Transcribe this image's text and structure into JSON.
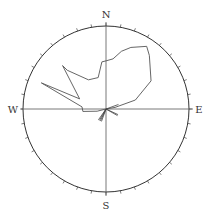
{
  "chart_data": {
    "type": "rose",
    "title": "",
    "directions": {
      "north": "N",
      "east": "E",
      "south": "S",
      "west": "W"
    },
    "tick_interval_deg": 10,
    "grid": false,
    "series": [
      {
        "name": "main-distribution",
        "style": "outline",
        "points_deg_radius_fraction": [
          [
            80,
            0.11
          ],
          [
            73,
            0.37
          ],
          [
            58,
            0.64
          ],
          [
            39,
            0.83
          ],
          [
            33,
            0.9
          ],
          [
            22,
            0.8
          ],
          [
            15,
            0.72
          ],
          [
            8,
            0.61
          ],
          [
            0,
            0.58
          ],
          [
            -5,
            0.57
          ],
          [
            -14,
            0.39
          ],
          [
            -31,
            0.41
          ],
          [
            -45,
            0.66
          ],
          [
            -45,
            0.74
          ],
          [
            -69,
            0.34
          ],
          [
            -68,
            0.84
          ],
          [
            -85,
            0.29
          ],
          [
            -96,
            0.28
          ],
          [
            -104,
            0.11
          ]
        ]
      },
      {
        "name": "minor-petals",
        "style": "hatched",
        "directions_deg": [
          200,
          205,
          210,
          215,
          115,
          120,
          70
        ],
        "radius_fraction": 0.16
      }
    ]
  },
  "colors": {
    "line": "#555555",
    "circle": "#333333",
    "axis": "#555555",
    "background": "#ffffff"
  }
}
